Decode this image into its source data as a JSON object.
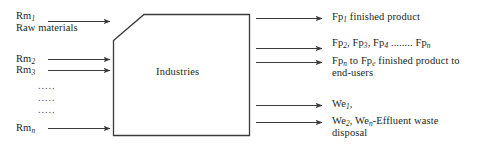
{
  "diagram": {
    "box": {
      "label": "Industries",
      "shape": "chamfered-rectangle"
    },
    "colors": {
      "stroke": "#3a3a3c",
      "text": "#231f20",
      "background": "#ffffff"
    },
    "inputs": [
      {
        "id": "rm1",
        "code": "Rm",
        "subscript": "1",
        "caption": "Raw materials",
        "arrow": true
      },
      {
        "id": "rm2",
        "code": "Rm",
        "subscript": "2",
        "caption": "",
        "arrow": true
      },
      {
        "id": "rm3",
        "code": "Rm",
        "subscript": "3",
        "caption": "",
        "arrow": true
      },
      {
        "id": "rmn",
        "code": "Rm",
        "subscript": "n",
        "caption": "",
        "arrow": true
      }
    ],
    "input_ellipsis": [
      ".....",
      ".....",
      "....."
    ],
    "outputs": [
      {
        "id": "fp1",
        "line1_pre": "Fp",
        "line1_sub": "1",
        "line1_post": " finished product",
        "line2": "",
        "arrow": true
      },
      {
        "id": "fp-series",
        "line1_pre": "Fp",
        "line1_sub": "2",
        "line1_post": ", Fp",
        "extra": ", Fp",
        "series_text": "Fp₂, Fp₃, Fp₄ ........ Fpₙ",
        "line2": "",
        "arrow": true
      },
      {
        "id": "fpn-fpe",
        "line1_pre": "Fp",
        "line1_sub": "n",
        "line1_post": " to Fp",
        "line2": "end-users",
        "full_text": "Fpₙ to Fpₑ finished product to end-users",
        "arrow": true
      },
      {
        "id": "we1",
        "line1_pre": "We",
        "line1_sub": "1",
        "line1_post": ",",
        "line2": "",
        "arrow": true
      },
      {
        "id": "we-effluent",
        "line1_pre": "We",
        "line1_sub": "2",
        "line1_post": ", We",
        "line2": "disposal",
        "full_text": "We₂, Weₙ-Effluent waste disposal",
        "arrow": true
      }
    ],
    "output_text": {
      "fp1_code": "Fp",
      "fp1_sub": "1",
      "fp1_rest": " finished product",
      "series_a": "Fp",
      "series_a_sub": "2",
      "series_b": ", Fp",
      "series_b_sub": "3",
      "series_c": ", Fp",
      "series_c_sub": "4",
      "series_dots": " ........ ",
      "series_d": "Fp",
      "series_d_sub": "n",
      "fpn_code": "Fp",
      "fpn_sub": "n",
      "fpn_mid": " to Fp",
      "fpe_sub": "e",
      "fpn_rest": " finished product to",
      "fpn_line2": "end-users",
      "we1_code": "We",
      "we1_sub": "1",
      "we1_rest": ",",
      "we2_code": "We",
      "we2_sub": "2",
      "we2_mid": ", We",
      "wen_sub": "n",
      "we2_rest": "-Effluent waste",
      "we2_line2": "disposal"
    },
    "input_text": {
      "rm1_code": "Rm",
      "rm1_sub": "1",
      "rm1_caption": "Raw materials",
      "rm2_code": "Rm",
      "rm2_sub": "2",
      "rm3_code": "Rm",
      "rm3_sub": "3",
      "rmn_code": "Rm",
      "rmn_sub": "n",
      "dots1": ".....",
      "dots2": ".....",
      "dots3": "....."
    }
  }
}
